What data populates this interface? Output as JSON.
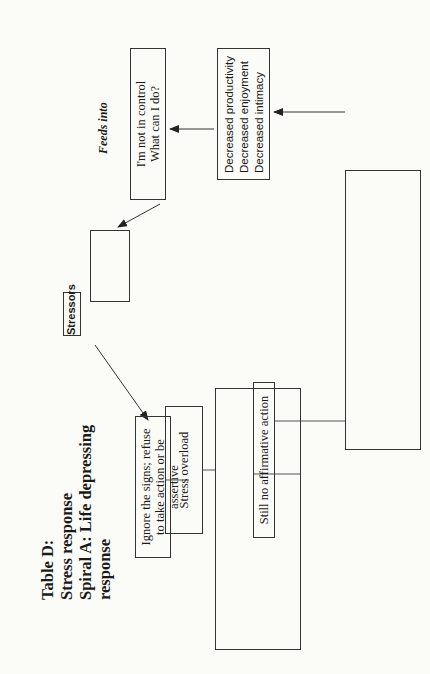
{
  "title": {
    "line1": "Table D:",
    "line2": "Stress response",
    "line3": "Spiral A: Life depressing",
    "line4": "response"
  },
  "stressors": {
    "label": "Stressors",
    "col1": [
      "Chemical",
      "Work",
      "Environment"
    ],
    "col2": [
      "Emotional",
      "Disease",
      "Physical"
    ],
    "center": "Family"
  },
  "feeds_into_label": "Feeds into",
  "not_in_control": {
    "line1": "I'm not in control",
    "line2": "What can I do?"
  },
  "decreased": {
    "items": [
      "Decreased productivity",
      "Decreased enjoyment",
      "Decreased intimacy"
    ]
  },
  "ignore_signs": {
    "line1": "Ignore the signs; refuse",
    "line2": "to take action or be assertive"
  },
  "stress_overload": "Stress overload",
  "short_term": {
    "col1": [
      "Overeating",
      "Overdrinking"
    ],
    "col2": [
      "Muscle tension",
      "High blood",
      "pressure",
      "Rapid heartbeat"
    ],
    "col3": [
      "Anxiety",
      "Depression",
      "Anger"
    ],
    "col4": [
      "Decreased",
      "concentration"
    ],
    "label": "Short-term effects"
  },
  "still_no_action": "Still no affirmative action",
  "long_term": {
    "col1": [
      "Obesity",
      "Alcholism"
    ],
    "col2": [
      "Hypertension",
      "Heart disease"
    ],
    "col3": [
      "Chronic",
      "depression,",
      "Phobias"
    ],
    "col4": [
      "Obsessive thoughts",
      "Memory loss",
      "Sleep disorders"
    ],
    "label": "Long term effects"
  },
  "colors": {
    "line": "#333333",
    "text": "#1a1a1a",
    "background": "#fbfbf8"
  }
}
